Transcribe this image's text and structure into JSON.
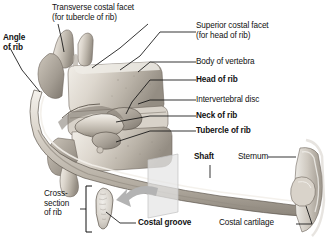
{
  "figure": {
    "type": "anatomical-illustration",
    "background": "#ffffff",
    "bone_light": "#e8e4dd",
    "bone_mid": "#c9c2b8",
    "bone_dark": "#8e877d",
    "line_color": "#111111",
    "plane_color": "#e2e2e2",
    "arrow_color": "#b0b0b0"
  },
  "labels": {
    "transverse_costal_facet": {
      "line1": "Transverse costal facet",
      "line2": "(for tubercle of rib)",
      "bold": false
    },
    "angle_of_rib": {
      "line1": "Angle",
      "line2": "of rib",
      "bold": true
    },
    "superior_costal_facet": {
      "line1": "Superior costal facet",
      "line2": "(for head of rib)",
      "bold": false
    },
    "body_of_vertebra": {
      "text": "Body of vertebra",
      "bold": false
    },
    "head_of_rib": {
      "text": "Head of rib",
      "bold": true
    },
    "intervertebral_disc": {
      "text": "Intervertebral disc",
      "bold": false
    },
    "neck_of_rib": {
      "text": "Neck of rib",
      "bold": true
    },
    "tubercle_of_rib": {
      "text": "Tubercle of rib",
      "bold": true
    },
    "shaft": {
      "text": "Shaft",
      "bold": true
    },
    "sternum": {
      "text": "Sternum",
      "bold": false
    },
    "cross_section": {
      "line1": "Cross-",
      "line2": "section",
      "line3": "of rib",
      "bold": false
    },
    "costal_groove": {
      "text": "Costal groove",
      "bold": true
    },
    "costal_cartilage": {
      "text": "Costal cartilage",
      "bold": false
    }
  }
}
